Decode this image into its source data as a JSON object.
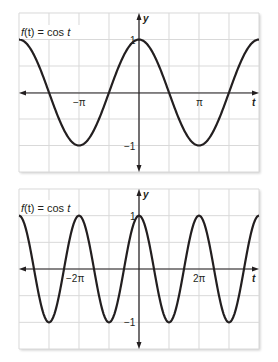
{
  "chart_data": [
    {
      "type": "line",
      "title": "f(t) = cos t",
      "xlabel": "t",
      "ylabel": "y",
      "function": "cos t",
      "xlim": [
        -6.2832,
        6.2832
      ],
      "ylim": [
        -1.5,
        1.5
      ],
      "grid": true,
      "x_grid_step": "π/2",
      "y_grid_step": 0.5,
      "x_tick_labels": [
        {
          "value": -3.1416,
          "label": "−π"
        },
        {
          "value": 3.1416,
          "label": "π"
        }
      ],
      "y_tick_labels": [
        {
          "value": 1,
          "label": "1"
        },
        {
          "value": -1,
          "label": "−1"
        }
      ],
      "key_points": [
        {
          "t": -6.2832,
          "y": 1
        },
        {
          "t": -4.7124,
          "y": 0
        },
        {
          "t": -3.1416,
          "y": -1
        },
        {
          "t": -1.5708,
          "y": 0
        },
        {
          "t": 0,
          "y": 1
        },
        {
          "t": 1.5708,
          "y": 0
        },
        {
          "t": 3.1416,
          "y": -1
        },
        {
          "t": 4.7124,
          "y": 0
        },
        {
          "t": 6.2832,
          "y": 1
        }
      ]
    },
    {
      "type": "line",
      "title": "f(t) = cos t",
      "xlabel": "t",
      "ylabel": "y",
      "function": "cos t",
      "xlim": [
        -12.5664,
        12.5664
      ],
      "ylim": [
        -1.5,
        1.5
      ],
      "grid": true,
      "x_grid_step": "π",
      "y_grid_step": 0.5,
      "x_tick_labels": [
        {
          "value": -6.2832,
          "label": "−2π"
        },
        {
          "value": 6.2832,
          "label": "2π"
        }
      ],
      "y_tick_labels": [
        {
          "value": 1,
          "label": "1"
        },
        {
          "value": -1,
          "label": "−1"
        }
      ],
      "key_points": [
        {
          "t": -12.5664,
          "y": 1
        },
        {
          "t": -9.4248,
          "y": -1
        },
        {
          "t": -6.2832,
          "y": 1
        },
        {
          "t": -3.1416,
          "y": -1
        },
        {
          "t": 0,
          "y": 1
        },
        {
          "t": 3.1416,
          "y": -1
        },
        {
          "t": 6.2832,
          "y": 1
        },
        {
          "t": 9.4248,
          "y": -1
        },
        {
          "t": 12.5664,
          "y": 1
        }
      ]
    }
  ],
  "charts": {
    "top": {
      "title_prefix": "f",
      "title_paren": "(t) = cos ",
      "title_var": "t",
      "x_axis_label": "t",
      "y_axis_label": "y",
      "x_tick_neg": "−π",
      "x_tick_pos": "π",
      "y_tick_pos": "1",
      "y_tick_neg": "−1"
    },
    "bottom": {
      "title_prefix": "f",
      "title_paren": "(t) = cos ",
      "title_var": "t",
      "x_axis_label": "t",
      "y_axis_label": "y",
      "x_tick_neg": "−2π",
      "x_tick_pos": "2π",
      "y_tick_pos": "1",
      "y_tick_neg": "−1"
    }
  },
  "colors": {
    "curve": "#231f20",
    "axis": "#231f20",
    "grid": "#d9d9d9",
    "background": "#ffffff"
  }
}
